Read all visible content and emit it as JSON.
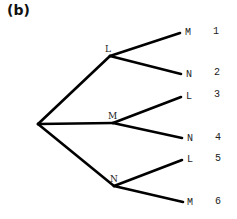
{
  "panel_label": "(b)",
  "tree": {
    "root": {
      "x": 38,
      "y": 124
    },
    "branches": [
      {
        "label": "L",
        "node": {
          "x": 110,
          "y": 56
        },
        "label_pos": {
          "x": 105,
          "y": 44
        },
        "leaves": [
          {
            "label": "M",
            "number": "1",
            "end": {
              "x": 180,
              "y": 33
            },
            "label_pos": {
              "x": 185,
              "y": 28
            },
            "num_pos": {
              "x": 213,
              "y": 27
            }
          },
          {
            "label": "N",
            "number": "2",
            "end": {
              "x": 181,
              "y": 74
            },
            "label_pos": {
              "x": 186,
              "y": 70
            },
            "num_pos": {
              "x": 214,
              "y": 68
            }
          }
        ]
      },
      {
        "label": "M",
        "node": {
          "x": 113,
          "y": 123
        },
        "label_pos": {
          "x": 108,
          "y": 111
        },
        "leaves": [
          {
            "label": "L",
            "number": "3",
            "end": {
              "x": 181,
              "y": 97
            },
            "label_pos": {
              "x": 186,
              "y": 92
            },
            "num_pos": {
              "x": 214,
              "y": 90
            }
          },
          {
            "label": "N",
            "number": "4",
            "end": {
              "x": 182,
              "y": 138
            },
            "label_pos": {
              "x": 187,
              "y": 134
            },
            "num_pos": {
              "x": 215,
              "y": 133
            }
          }
        ]
      },
      {
        "label": "N",
        "node": {
          "x": 114,
          "y": 186
        },
        "label_pos": {
          "x": 110,
          "y": 174
        },
        "leaves": [
          {
            "label": "L",
            "number": "5",
            "end": {
              "x": 182,
              "y": 160
            },
            "label_pos": {
              "x": 187,
              "y": 155
            },
            "num_pos": {
              "x": 215,
              "y": 154
            }
          },
          {
            "label": "M",
            "number": "6",
            "end": {
              "x": 183,
              "y": 202
            },
            "label_pos": {
              "x": 187,
              "y": 198
            },
            "num_pos": {
              "x": 215,
              "y": 197
            }
          }
        ]
      }
    ]
  }
}
